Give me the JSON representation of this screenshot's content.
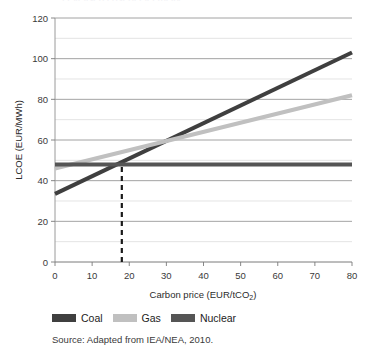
{
  "chart_data": {
    "type": "line",
    "title": "",
    "xlabel": "Carbon price (EUR/tCO",
    "xlabel_sub": "2",
    "xlabel_suffix": ")",
    "ylabel": "LCOE (EUR/MWh)",
    "xlim": [
      0,
      80
    ],
    "ylim": [
      0,
      120
    ],
    "xticks": [
      0,
      10,
      20,
      30,
      40,
      50,
      60,
      70,
      80
    ],
    "yticks": [
      0,
      20,
      40,
      60,
      80,
      100,
      120
    ],
    "ygridlines": [
      10,
      20,
      30,
      40,
      50,
      60,
      70,
      80,
      90,
      100,
      110
    ],
    "grid": "horizontal",
    "legend_position": "below-plot",
    "series": [
      {
        "name": "Coal",
        "color": "#3f3f3f",
        "x": [
          0,
          80
        ],
        "values": [
          33.5,
          103
        ]
      },
      {
        "name": "Gas",
        "color": "#c0c0c0",
        "x": [
          0,
          80
        ],
        "values": [
          46,
          82
        ]
      },
      {
        "name": "Nuclear",
        "color": "#555555",
        "x": [
          0,
          80
        ],
        "values": [
          48,
          48
        ]
      }
    ],
    "annotations": [
      {
        "name": "break-even-marker",
        "type": "dashed-vertical-line",
        "x": 18,
        "y_from": 0,
        "y_to": 48,
        "color": "#1a1a1a"
      }
    ],
    "source": "Source: Adapted from IEA/NEA, 2010.",
    "title_remnant": "Levelised cost of electricity"
  },
  "legend": {
    "items": [
      {
        "label": "Coal",
        "color": "#3f3f3f"
      },
      {
        "label": "Gas",
        "color": "#c0c0c0"
      },
      {
        "label": "Nuclear",
        "color": "#555555"
      }
    ]
  },
  "axes": {
    "x_tick_labels": [
      "0",
      "10",
      "20",
      "30",
      "40",
      "50",
      "60",
      "70",
      "80"
    ],
    "y_tick_labels": [
      "0",
      "20",
      "40",
      "60",
      "80",
      "100",
      "120"
    ]
  }
}
